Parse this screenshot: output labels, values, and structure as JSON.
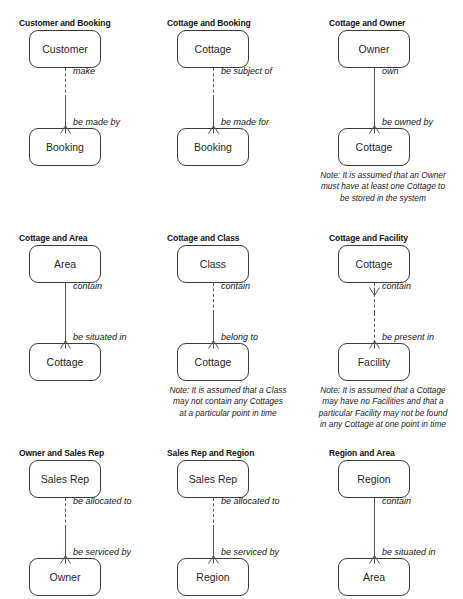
{
  "page": {
    "background_color": "#ffffff",
    "box_border_color": "#3a3a3a",
    "line_color": "#555555",
    "text_color": "#1a1a1a"
  },
  "legend": {
    "dashed_meaning": "optional (may)",
    "solid_meaning": "mandatory (must)",
    "crowsfoot_meaning": "many"
  },
  "diagrams": [
    {
      "id": "customer-and-booking",
      "title": "Customer and Booking",
      "top_entity": "Customer",
      "bottom_entity": "Booking",
      "top_label": "make",
      "bottom_label": "be made by",
      "upper_style": "dashed",
      "lower_style": "solid",
      "top_crowsfoot": false,
      "bottom_crowsfoot": true,
      "note": []
    },
    {
      "id": "cottage-and-booking",
      "title": "Cottage and Booking",
      "top_entity": "Cottage",
      "bottom_entity": "Booking",
      "top_label": "be subject of",
      "bottom_label": "be made for",
      "upper_style": "dashed",
      "lower_style": "solid",
      "top_crowsfoot": false,
      "bottom_crowsfoot": true,
      "note": []
    },
    {
      "id": "cottage-and-owner",
      "title": "Cottage and Owner",
      "top_entity": "Owner",
      "bottom_entity": "Cottage",
      "top_label": "own",
      "bottom_label": "be owned by",
      "upper_style": "solid",
      "lower_style": "solid",
      "top_crowsfoot": false,
      "bottom_crowsfoot": true,
      "note": [
        "Note: It is assumed that an Owner",
        "must have at least one Cottage to",
        "be stored in the system"
      ]
    },
    {
      "id": "cottage-and-area",
      "title": "Cottage and Area",
      "top_entity": "Area",
      "bottom_entity": "Cottage",
      "top_label": "contain",
      "bottom_label": "be situated in",
      "upper_style": "solid",
      "lower_style": "solid",
      "top_crowsfoot": false,
      "bottom_crowsfoot": true,
      "note": []
    },
    {
      "id": "cottage-and-class",
      "title": "Cottage and Class",
      "top_entity": "Class",
      "bottom_entity": "Cottage",
      "top_label": "contain",
      "bottom_label": "belong to",
      "upper_style": "dashed",
      "lower_style": "solid",
      "top_crowsfoot": false,
      "bottom_crowsfoot": true,
      "note": [
        "Note: It is assumed that a Class",
        "may not contain any Cottages",
        "at a particular point in time"
      ]
    },
    {
      "id": "cottage-and-facility",
      "title": "Cottage and Facility",
      "top_entity": "Cottage",
      "bottom_entity": "Facility",
      "top_label": "contain",
      "bottom_label": "be present in",
      "upper_style": "dashed",
      "lower_style": "dashed",
      "top_crowsfoot": true,
      "bottom_crowsfoot": true,
      "note": [
        "Note: It is assumed that a Cottage",
        "may have no Facilities and that a",
        "particular Facility may not be found",
        "in any Cottage at one point in time"
      ]
    },
    {
      "id": "owner-and-sales-rep",
      "title": "Owner and Sales Rep",
      "top_entity": "Sales Rep",
      "bottom_entity": "Owner",
      "top_label": "be allocated to",
      "bottom_label": "be serviced by",
      "upper_style": "dashed",
      "lower_style": "solid",
      "top_crowsfoot": false,
      "bottom_crowsfoot": true,
      "note": []
    },
    {
      "id": "sales-rep-and-region",
      "title": "Sales Rep and Region",
      "top_entity": "Sales Rep",
      "bottom_entity": "Region",
      "top_label": "be allocated to",
      "bottom_label": "be serviced by",
      "upper_style": "dashed",
      "lower_style": "solid",
      "top_crowsfoot": false,
      "bottom_crowsfoot": true,
      "note": []
    },
    {
      "id": "region-and-area",
      "title": "Region and Area",
      "top_entity": "Region",
      "bottom_entity": "Area",
      "top_label": "contain",
      "bottom_label": "be situated in",
      "upper_style": "solid",
      "lower_style": "solid",
      "top_crowsfoot": false,
      "bottom_crowsfoot": true,
      "note": []
    }
  ]
}
